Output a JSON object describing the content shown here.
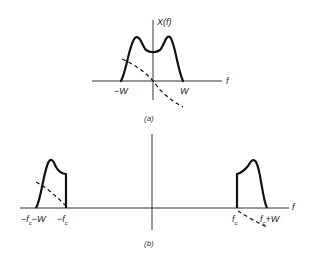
{
  "figure": {
    "panel_a": {
      "caption": "(a)",
      "y_axis_label": "X(f)",
      "x_axis_label": "f",
      "tick_labels": {
        "neg_w": "−W",
        "pos_w": "W"
      },
      "description": "Baseband spectrum |X(f)| (solid, bimodal, band-limited to [−W, W]) and phase (dashed)"
    },
    "panel_b": {
      "caption": "(b)",
      "x_axis_label": "f",
      "tick_labels": {
        "left_outer": "−f",
        "left_outer_sub": "c",
        "left_outer_suffix": "−W",
        "left_inner": "−f",
        "left_inner_sub": "c",
        "right_inner": "f",
        "right_inner_sub": "c",
        "right_outer": "f",
        "right_outer_sub": "c",
        "right_outer_suffix": "+W"
      },
      "description": "Upper and lower sidebands shifted to ±fc (solid magnitude, dashed phase)"
    },
    "colors": {
      "stroke": "#111111",
      "axis": "#333333",
      "background": "#ffffff"
    }
  }
}
